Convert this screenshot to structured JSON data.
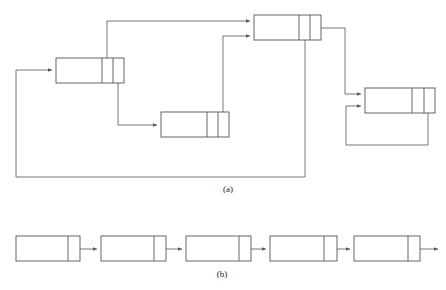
{
  "figure": {
    "title": "",
    "panels": [
      {
        "id": "panel-a",
        "label": "(a)",
        "label_x": 228,
        "label_y": 192,
        "description": "Graph of multi-pointer nodes with cross links and feedback loops",
        "node_kind": "two-pointer-node",
        "nodes": [
          {
            "id": "node-a1",
            "x": 254,
            "y": 15,
            "w": 67,
            "h": 25,
            "cells": [
              45,
              11,
              11
            ]
          },
          {
            "id": "node-a2",
            "x": 56,
            "y": 58,
            "w": 68,
            "h": 25,
            "cells": [
              46,
              11,
              11
            ]
          },
          {
            "id": "node-a3",
            "x": 161,
            "y": 112,
            "w": 68,
            "h": 25,
            "cells": [
              46,
              11,
              11
            ]
          },
          {
            "id": "node-a4",
            "x": 365,
            "y": 88,
            "w": 70,
            "h": 25,
            "cells": [
              47,
              12,
              11
            ]
          }
        ],
        "edges": [
          {
            "id": "edge-a2-to-a1",
            "from": "node-a2",
            "to": "node-a1",
            "path": "M 107 58 L 107 21 L 250 21"
          },
          {
            "id": "edge-a3-to-a1",
            "from": "node-a3",
            "to": "node-a1",
            "path": "M 223 112 L 223 36 L 250 36"
          },
          {
            "id": "edge-a2-to-a3",
            "from": "node-a2",
            "to": "node-a3",
            "path": "M 118 83 L 118 125 L 157 125"
          },
          {
            "id": "edge-a1-to-a4",
            "from": "node-a1",
            "to": "node-a4",
            "path": "M 321 28 L 345 28 L 345 94 L 361 94"
          },
          {
            "id": "edge-a4-self",
            "from": "node-a4",
            "to": "node-a4",
            "path": "M 428 113 L 428 145 L 346 145 L 346 106 L 361 106"
          },
          {
            "id": "edge-a1-to-a2-feedback",
            "from": "node-a1",
            "to": "node-a2",
            "path": "M 305 40 L 305 177 L 16 177 L 16 70 L 52 70"
          }
        ]
      },
      {
        "id": "panel-b",
        "label": "(b)",
        "label_x": 222,
        "label_y": 277,
        "description": "Linear singly-linked chain of five one-pointer nodes",
        "node_kind": "one-pointer-node",
        "nodes": [
          {
            "id": "node-b1",
            "x": 16,
            "y": 236,
            "w": 64,
            "h": 25,
            "cells": [
              52,
              12
            ]
          },
          {
            "id": "node-b2",
            "x": 101,
            "y": 236,
            "w": 65,
            "h": 25,
            "cells": [
              53,
              12
            ]
          },
          {
            "id": "node-b3",
            "x": 186,
            "y": 236,
            "w": 65,
            "h": 25,
            "cells": [
              53,
              12
            ]
          },
          {
            "id": "node-b4",
            "x": 270,
            "y": 236,
            "w": 67,
            "h": 25,
            "cells": [
              54,
              13
            ]
          },
          {
            "id": "node-b5",
            "x": 354,
            "y": 236,
            "w": 66,
            "h": 25,
            "cells": [
              54,
              12
            ]
          }
        ],
        "edges": [
          {
            "id": "edge-b1-b2",
            "from": "node-b1",
            "to": "node-b2",
            "path": "M 74 249 L 97 249"
          },
          {
            "id": "edge-b2-b3",
            "from": "node-b2",
            "to": "node-b3",
            "path": "M 159 249 L 182 249"
          },
          {
            "id": "edge-b3-b4",
            "from": "node-b3",
            "to": "node-b4",
            "path": "M 244 249 L 266 249"
          },
          {
            "id": "edge-b4-b5",
            "from": "node-b4",
            "to": "node-b5",
            "path": "M 330 249 L 350 249"
          },
          {
            "id": "edge-b5-out",
            "from": "node-b5",
            "to": "",
            "path": "M 413 249 L 438 249"
          }
        ]
      }
    ],
    "colors": {
      "stroke": "#555555",
      "edge": "#666666",
      "fill": "#ffffff",
      "label": "#222222"
    }
  }
}
